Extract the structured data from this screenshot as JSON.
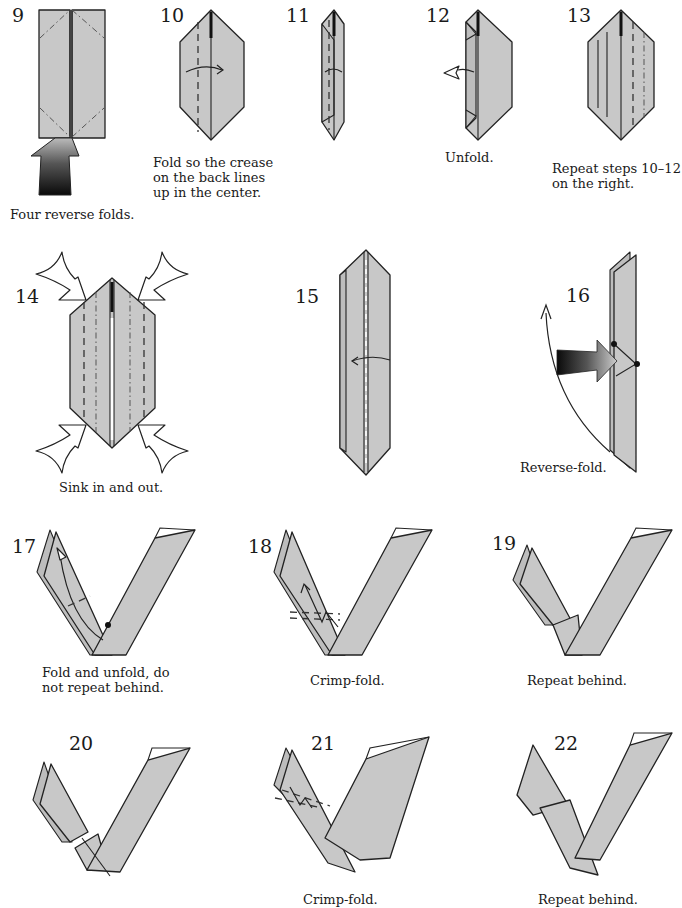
{
  "colors": {
    "paper": "#c8c8c8",
    "line": "#222222",
    "background": "#ffffff"
  },
  "steps": [
    {
      "number": "9",
      "caption": "Four reverse folds.",
      "symbols": [
        "mountain-fold-lines",
        "push-arrow"
      ]
    },
    {
      "number": "10",
      "caption": "Fold so the crease\non the back lines\nup in the center.",
      "symbols": [
        "valley-fold-line",
        "fold-arrow"
      ]
    },
    {
      "number": "11",
      "caption": "",
      "symbols": [
        "valley-fold-line",
        "fold-arrow"
      ]
    },
    {
      "number": "12",
      "caption": "Unfold.",
      "symbols": [
        "unfold-arrow"
      ]
    },
    {
      "number": "13",
      "caption": "Repeat steps 10–12\non the right.",
      "symbols": [
        "crease-lines",
        "valley-fold-line",
        "mountain-fold-line"
      ]
    },
    {
      "number": "14",
      "caption": "Sink in and out.",
      "symbols": [
        "sink-arrows",
        "valley-fold-lines",
        "mountain-fold-lines"
      ]
    },
    {
      "number": "15",
      "caption": "",
      "symbols": [
        "valley-fold-line",
        "fold-arrow"
      ]
    },
    {
      "number": "16",
      "caption": "Reverse-fold.",
      "symbols": [
        "push-arrow",
        "reference-dots",
        "fold-arrow"
      ]
    },
    {
      "number": "17",
      "caption": "Fold and unfold, do\nnot repeat behind.",
      "symbols": [
        "fold-unfold-arrow",
        "valley-fold-line",
        "reference-dot"
      ]
    },
    {
      "number": "18",
      "caption": "Crimp-fold.",
      "symbols": [
        "crimp-arrow",
        "valley-fold-lines"
      ]
    },
    {
      "number": "19",
      "caption": "Repeat behind.",
      "symbols": []
    },
    {
      "number": "20",
      "caption": "",
      "symbols": []
    },
    {
      "number": "21",
      "caption": "Crimp-fold.",
      "symbols": [
        "crimp-arrow",
        "valley-fold-lines"
      ]
    },
    {
      "number": "22",
      "caption": "Repeat behind.",
      "symbols": []
    }
  ]
}
